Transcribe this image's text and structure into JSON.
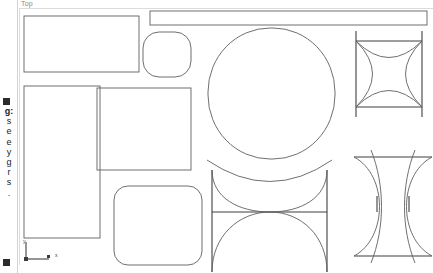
{
  "app": {
    "view_label": "Top",
    "background_color": "#ffffff",
    "stroke_color": "#5a5a5a",
    "divider_color": "#d3d3d3",
    "frame_color": "#dcdcdc"
  },
  "sidebar": {
    "bullet_top": "■",
    "bullet_bottom": "■",
    "wrapped_characters": [
      "g:",
      "s",
      "e",
      "e",
      "y",
      "g",
      "r",
      "s",
      "."
    ]
  },
  "axis_indicator": {
    "name": "xy-axis-triad",
    "x_label": "x",
    "y_label": "y"
  },
  "shapes": [
    {
      "name": "rectangle-top-left",
      "type": "rect",
      "x": 5,
      "y": 16,
      "w": 115,
      "h": 56
    },
    {
      "name": "rectangle-top-banner",
      "type": "rect",
      "x": 131,
      "y": 11,
      "w": 277,
      "h": 14
    },
    {
      "name": "squircle-upper-middle",
      "type": "roundrect",
      "x": 124,
      "y": 32,
      "w": 48,
      "h": 45,
      "r": 16
    },
    {
      "name": "circle-center-large",
      "type": "roundrect",
      "x": 189,
      "y": 28,
      "w": 127,
      "h": 131,
      "r": 62
    },
    {
      "name": "rectangle-middle-left",
      "type": "rect",
      "x": 5,
      "y": 86,
      "w": 76,
      "h": 152
    },
    {
      "name": "rectangle-middle-center",
      "type": "rect",
      "x": 78,
      "y": 88,
      "w": 94,
      "h": 82
    },
    {
      "name": "roundrect-bottom-left",
      "type": "roundrect",
      "x": 95,
      "y": 186,
      "w": 88,
      "h": 79,
      "r": 14
    },
    {
      "name": "arc-star-square-top-right",
      "type": "arc-star",
      "x": 337,
      "y": 41,
      "w": 66,
      "h": 66
    },
    {
      "name": "arc-lens-bottom-right",
      "type": "arc-lens",
      "x": 335,
      "y": 150,
      "w": 78,
      "h": 110
    },
    {
      "name": "arc-hourglass-bottom-mid",
      "type": "arc-hourglass",
      "x": 188,
      "y": 160,
      "w": 125,
      "h": 110
    }
  ]
}
